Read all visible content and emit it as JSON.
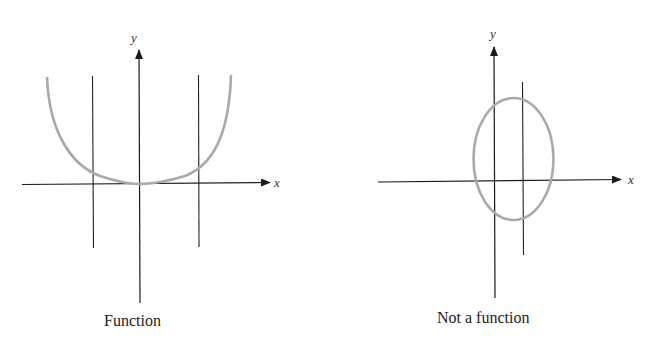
{
  "figure": {
    "panels": [
      {
        "id": "function",
        "caption": "Function",
        "x_axis_label": "x",
        "y_axis_label": "y",
        "curve": "U-shaped curve touching origin",
        "vertical_line_test": "each vertical line crosses curve once"
      },
      {
        "id": "not-a-function",
        "caption": "Not a function",
        "x_axis_label": "x",
        "y_axis_label": "y",
        "curve": "ellipse",
        "vertical_line_test": "vertical line crosses curve twice"
      }
    ],
    "colors": {
      "axes": "#1a1a1a",
      "curve": "#a9a9a9",
      "background": "#ffffff"
    }
  }
}
